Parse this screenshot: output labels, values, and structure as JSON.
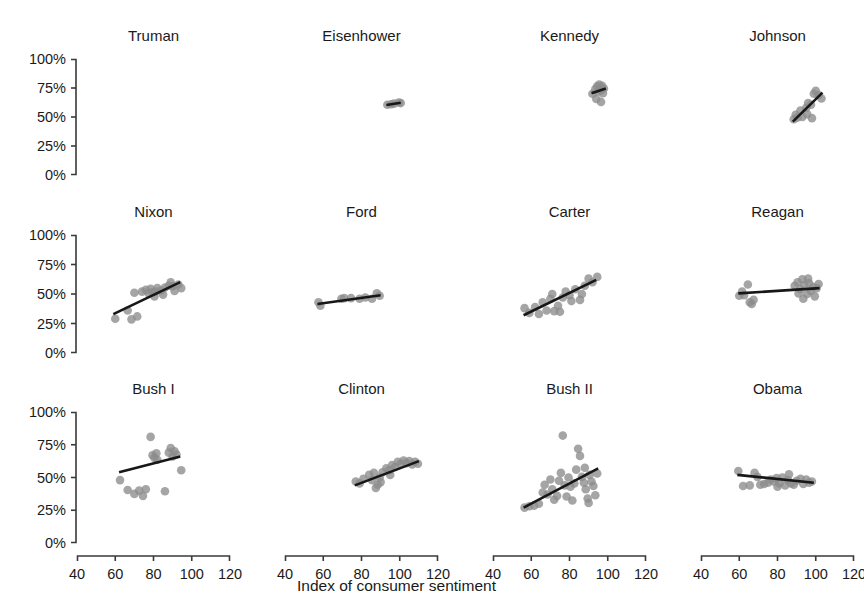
{
  "chart_data": {
    "type": "scatter",
    "title": "",
    "xlabel": "Index of consumer sentiment",
    "ylabel": "",
    "xlim": [
      30,
      125
    ],
    "ylim": [
      0,
      105
    ],
    "xticks": [
      40,
      60,
      80,
      100,
      120
    ],
    "xtick_labels": [
      "40",
      "60",
      "80",
      "100",
      "120"
    ],
    "yticks": [
      0,
      25,
      50,
      75,
      100
    ],
    "ytick_labels": [
      "0%",
      "25%",
      "50%",
      "75%",
      "100%"
    ],
    "grid": false,
    "legend": "none",
    "layout": {
      "rows": 3,
      "cols": 4,
      "facet": "president"
    },
    "point_color": "#8c8c8c",
    "line_color": "#171717",
    "panels": [
      {
        "label": "Truman",
        "row": 0,
        "col": 0,
        "points": [],
        "fit": null
      },
      {
        "label": "Eisenhower",
        "row": 0,
        "col": 1,
        "points": [
          [
            93.5,
            60.5
          ],
          [
            95.5,
            61.0
          ],
          [
            97.0,
            61.5
          ],
          [
            99.5,
            62.5
          ],
          [
            100.5,
            62.0
          ]
        ],
        "fit": {
          "x0": 93.0,
          "y0": 60.3,
          "x1": 100.5,
          "y1": 62.3
        }
      },
      {
        "label": "Kennedy",
        "row": 0,
        "col": 2,
        "points": [
          [
            92.0,
            70.0
          ],
          [
            93.5,
            74.0
          ],
          [
            94.5,
            76.5
          ],
          [
            95.0,
            72.0
          ],
          [
            95.5,
            78.0
          ],
          [
            96.0,
            75.0
          ],
          [
            96.5,
            73.0
          ],
          [
            97.0,
            77.0
          ],
          [
            97.5,
            70.5
          ],
          [
            98.0,
            74.5
          ],
          [
            94.0,
            65.5
          ],
          [
            96.5,
            63.0
          ]
        ],
        "fit": {
          "x0": 91.5,
          "y0": 70.5,
          "x1": 99.0,
          "y1": 74.5
        }
      },
      {
        "label": "Johnson",
        "row": 0,
        "col": 3,
        "points": [
          [
            88.5,
            48.0
          ],
          [
            89.5,
            52.0
          ],
          [
            90.5,
            49.5
          ],
          [
            92.0,
            55.5
          ],
          [
            93.0,
            50.0
          ],
          [
            95.0,
            58.0
          ],
          [
            96.0,
            62.0
          ],
          [
            97.5,
            60.5
          ],
          [
            99.0,
            70.0
          ],
          [
            100.0,
            72.5
          ],
          [
            101.5,
            69.0
          ],
          [
            103.0,
            66.0
          ],
          [
            95.5,
            52.5
          ],
          [
            98.0,
            49.0
          ]
        ],
        "fit": {
          "x0": 88.0,
          "y0": 46.0,
          "x1": 103.5,
          "y1": 71.0
        }
      },
      {
        "label": "Nixon",
        "row": 1,
        "col": 0,
        "points": [
          [
            60.0,
            29.0
          ],
          [
            66.5,
            36.0
          ],
          [
            68.5,
            28.5
          ],
          [
            71.5,
            31.0
          ],
          [
            70.0,
            51.0
          ],
          [
            74.0,
            52.0
          ],
          [
            76.0,
            53.5
          ],
          [
            77.5,
            50.5
          ],
          [
            78.5,
            54.5
          ],
          [
            79.5,
            51.5
          ],
          [
            80.5,
            48.0
          ],
          [
            82.0,
            55.0
          ],
          [
            84.0,
            53.0
          ],
          [
            86.0,
            55.5
          ],
          [
            88.0,
            57.0
          ],
          [
            90.0,
            56.5
          ],
          [
            91.0,
            52.5
          ],
          [
            93.0,
            58.0
          ],
          [
            94.5,
            55.0
          ],
          [
            89.0,
            60.0
          ],
          [
            85.0,
            49.5
          ],
          [
            81.0,
            52.0
          ]
        ],
        "fit": {
          "x0": 59.0,
          "y0": 33.0,
          "x1": 94.0,
          "y1": 60.0
        }
      },
      {
        "label": "Ford",
        "row": 1,
        "col": 1,
        "points": [
          [
            57.5,
            43.0
          ],
          [
            58.5,
            40.0
          ],
          [
            69.5,
            46.0
          ],
          [
            71.0,
            46.5
          ],
          [
            74.5,
            46.5
          ],
          [
            79.0,
            46.0
          ],
          [
            82.0,
            47.0
          ],
          [
            85.5,
            46.0
          ],
          [
            88.0,
            50.5
          ],
          [
            89.5,
            48.5
          ]
        ],
        "fit": {
          "x0": 57.0,
          "y0": 41.5,
          "x1": 90.0,
          "y1": 49.0
        }
      },
      {
        "label": "Carter",
        "row": 1,
        "col": 2,
        "points": [
          [
            56.5,
            38.0
          ],
          [
            59.0,
            34.0
          ],
          [
            62.0,
            39.0
          ],
          [
            64.0,
            33.0
          ],
          [
            66.0,
            43.0
          ],
          [
            68.0,
            36.0
          ],
          [
            70.0,
            46.0
          ],
          [
            72.0,
            35.5
          ],
          [
            74.0,
            40.0
          ],
          [
            75.0,
            35.0
          ],
          [
            76.5,
            47.0
          ],
          [
            78.0,
            52.0
          ],
          [
            80.0,
            49.0
          ],
          [
            83.0,
            54.0
          ],
          [
            85.5,
            45.0
          ],
          [
            86.5,
            50.0
          ],
          [
            88.0,
            57.0
          ],
          [
            90.0,
            63.0
          ],
          [
            92.0,
            60.0
          ],
          [
            94.5,
            64.5
          ],
          [
            71.0,
            50.0
          ],
          [
            81.0,
            44.0
          ]
        ],
        "fit": {
          "x0": 56.0,
          "y0": 32.0,
          "x1": 94.0,
          "y1": 62.0
        }
      },
      {
        "label": "Reagan",
        "row": 1,
        "col": 3,
        "points": [
          [
            60.0,
            48.5
          ],
          [
            61.5,
            52.0
          ],
          [
            62.5,
            49.0
          ],
          [
            64.5,
            58.0
          ],
          [
            65.5,
            43.0
          ],
          [
            66.5,
            41.5
          ],
          [
            67.5,
            45.0
          ],
          [
            89.0,
            57.0
          ],
          [
            90.5,
            60.0
          ],
          [
            92.0,
            54.0
          ],
          [
            93.0,
            62.5
          ],
          [
            94.0,
            57.5
          ],
          [
            95.5,
            50.0
          ],
          [
            96.5,
            59.0
          ],
          [
            97.5,
            52.5
          ],
          [
            98.5,
            56.0
          ],
          [
            99.5,
            48.0
          ],
          [
            100.5,
            55.0
          ],
          [
            101.5,
            58.5
          ],
          [
            93.5,
            46.0
          ],
          [
            91.0,
            50.5
          ],
          [
            96.0,
            63.0
          ]
        ],
        "fit": {
          "x0": 59.5,
          "y0": 50.5,
          "x1": 102.0,
          "y1": 55.0
        }
      },
      {
        "label": "Bush I",
        "row": 2,
        "col": 0,
        "points": [
          [
            62.5,
            48.0
          ],
          [
            66.5,
            40.5
          ],
          [
            70.0,
            37.5
          ],
          [
            72.5,
            40.0
          ],
          [
            74.5,
            36.0
          ],
          [
            76.0,
            41.0
          ],
          [
            78.5,
            81.0
          ],
          [
            79.5,
            67.0
          ],
          [
            80.5,
            65.0
          ],
          [
            81.5,
            68.5
          ],
          [
            82.0,
            63.5
          ],
          [
            88.0,
            69.0
          ],
          [
            89.0,
            72.5
          ],
          [
            90.0,
            66.0
          ],
          [
            91.0,
            70.0
          ],
          [
            92.0,
            67.5
          ],
          [
            94.5,
            55.5
          ],
          [
            86.0,
            39.5
          ]
        ],
        "fit": {
          "x0": 62.0,
          "y0": 54.0,
          "x1": 94.0,
          "y1": 66.0
        }
      },
      {
        "label": "Clinton",
        "row": 2,
        "col": 1,
        "points": [
          [
            77.0,
            47.0
          ],
          [
            79.0,
            45.5
          ],
          [
            81.0,
            49.0
          ],
          [
            84.0,
            52.0
          ],
          [
            85.5,
            48.0
          ],
          [
            86.5,
            53.5
          ],
          [
            87.5,
            42.0
          ],
          [
            88.5,
            44.5
          ],
          [
            89.5,
            50.0
          ],
          [
            91.0,
            54.0
          ],
          [
            93.0,
            57.0
          ],
          [
            94.5,
            55.5
          ],
          [
            96.0,
            59.5
          ],
          [
            97.5,
            58.0
          ],
          [
            99.0,
            62.0
          ],
          [
            100.5,
            60.5
          ],
          [
            102.0,
            63.0
          ],
          [
            103.5,
            61.0
          ],
          [
            105.0,
            62.5
          ],
          [
            106.5,
            60.0
          ],
          [
            108.0,
            62.0
          ],
          [
            109.5,
            60.5
          ],
          [
            95.0,
            52.0
          ],
          [
            90.0,
            46.5
          ]
        ],
        "fit": {
          "x0": 76.5,
          "y0": 44.0,
          "x1": 110.0,
          "y1": 62.5
        }
      },
      {
        "label": "Bush II",
        "row": 2,
        "col": 2,
        "points": [
          [
            56.5,
            27.0
          ],
          [
            59.0,
            28.0
          ],
          [
            61.5,
            28.5
          ],
          [
            64.0,
            30.0
          ],
          [
            66.0,
            38.5
          ],
          [
            67.0,
            44.5
          ],
          [
            68.5,
            37.0
          ],
          [
            70.0,
            48.5
          ],
          [
            71.0,
            41.0
          ],
          [
            72.0,
            33.0
          ],
          [
            73.5,
            36.0
          ],
          [
            74.5,
            47.5
          ],
          [
            75.5,
            53.5
          ],
          [
            76.5,
            82.0
          ],
          [
            77.5,
            44.0
          ],
          [
            78.5,
            35.5
          ],
          [
            79.5,
            50.0
          ],
          [
            80.5,
            43.0
          ],
          [
            81.5,
            32.5
          ],
          [
            82.5,
            45.5
          ],
          [
            83.5,
            56.0
          ],
          [
            84.5,
            72.0
          ],
          [
            85.5,
            66.5
          ],
          [
            86.5,
            50.5
          ],
          [
            87.5,
            46.0
          ],
          [
            88.5,
            41.0
          ],
          [
            89.5,
            34.0
          ],
          [
            90.5,
            52.0
          ],
          [
            91.5,
            47.0
          ],
          [
            92.5,
            43.5
          ],
          [
            93.5,
            36.5
          ],
          [
            94.5,
            53.0
          ],
          [
            88.0,
            57.5
          ],
          [
            90.0,
            30.5
          ]
        ],
        "fit": {
          "x0": 56.0,
          "y0": 27.0,
          "x1": 95.0,
          "y1": 57.0
        }
      },
      {
        "label": "Obama",
        "row": 2,
        "col": 3,
        "points": [
          [
            59.5,
            55.0
          ],
          [
            62.0,
            43.5
          ],
          [
            65.5,
            44.0
          ],
          [
            68.0,
            53.5
          ],
          [
            69.5,
            50.5
          ],
          [
            71.0,
            44.5
          ],
          [
            73.0,
            45.0
          ],
          [
            75.0,
            46.0
          ],
          [
            76.5,
            48.5
          ],
          [
            78.0,
            47.0
          ],
          [
            79.5,
            49.5
          ],
          [
            81.0,
            45.5
          ],
          [
            82.5,
            50.0
          ],
          [
            84.0,
            44.0
          ],
          [
            85.5,
            48.0
          ],
          [
            87.0,
            45.5
          ],
          [
            88.5,
            44.5
          ],
          [
            90.0,
            47.5
          ],
          [
            92.0,
            49.0
          ],
          [
            93.5,
            45.0
          ],
          [
            95.0,
            48.5
          ],
          [
            96.5,
            46.0
          ],
          [
            98.0,
            47.0
          ],
          [
            80.0,
            43.0
          ],
          [
            86.0,
            52.5
          ]
        ],
        "fit": {
          "x0": 59.0,
          "y0": 52.0,
          "x1": 99.0,
          "y1": 46.0
        }
      }
    ]
  }
}
